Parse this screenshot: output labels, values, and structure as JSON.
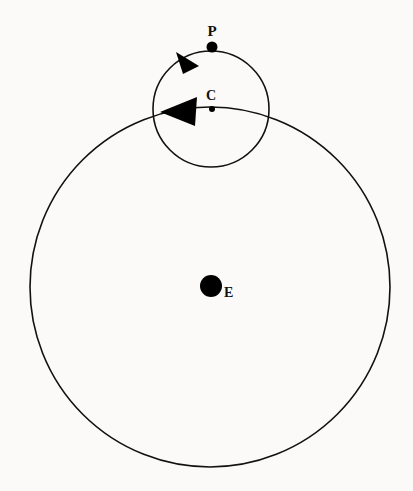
{
  "figure": {
    "background_color": "#fbfaf8",
    "stroke_color": "#111111",
    "fill_color": "#000000",
    "width": 413,
    "height": 491
  },
  "labels": {
    "planet": "P",
    "epicycle_center": "C",
    "earth": "E"
  },
  "chart_data": {
    "type": "diagram",
    "deferent": {
      "name": "deferent",
      "center_x": 210,
      "center_y": 287,
      "radius": 180,
      "stroke_width": 1.6
    },
    "epicycle": {
      "name": "epicycle",
      "center_x": 211,
      "center_y": 109,
      "radius": 58,
      "stroke_width": 1.6
    },
    "points": [
      {
        "id": "P",
        "label": "P",
        "x": 212,
        "y": 47,
        "dot_radius": 5.5,
        "label_x": 212,
        "label_y": 32
      },
      {
        "id": "C",
        "label": "C",
        "x": 212,
        "y": 109,
        "dot_radius": 3.0,
        "label_x": 210,
        "label_y": 98
      },
      {
        "id": "E",
        "label": "E",
        "x": 211,
        "y": 286,
        "dot_radius": 11.0,
        "label_x": 228,
        "label_y": 295
      }
    ],
    "arrows": [
      {
        "id": "epicycle-motion-arrow",
        "on": "epicycle",
        "direction": "counterclockwise",
        "tip_x": 176,
        "tip_y": 52,
        "points": "176,52 199,66 183,74"
      },
      {
        "id": "deferent-motion-arrow",
        "on": "deferent",
        "direction": "counterclockwise",
        "tip_x": 160,
        "tip_y": 112,
        "points": "160,112 197,97 195,126"
      }
    ]
  }
}
